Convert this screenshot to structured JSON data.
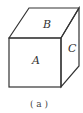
{
  "figure": {
    "faces": {
      "top": "B",
      "front": "A",
      "right": "C"
    },
    "caption": "( a )",
    "stroke_color": "#333333"
  }
}
